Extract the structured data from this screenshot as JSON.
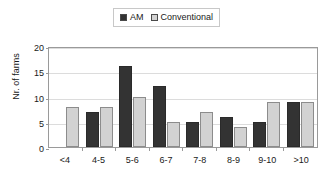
{
  "chart_data": {
    "type": "bar",
    "title": "",
    "xlabel": "",
    "ylabel": "Nr. of farms",
    "categories": [
      "<4",
      "4-5",
      "5-6",
      "6-7",
      "7-8",
      "8-9",
      "9-10",
      ">10"
    ],
    "series": [
      {
        "name": "AM",
        "color": "#333333",
        "values": [
          0,
          7,
          16,
          12,
          5,
          6,
          5,
          9
        ]
      },
      {
        "name": "Conventional",
        "color": "#d2d2d2",
        "values": [
          8,
          8,
          10,
          5,
          7,
          4,
          9,
          9
        ]
      }
    ],
    "ylim": [
      0,
      20
    ],
    "yticks": [
      0,
      5,
      10,
      15,
      20
    ],
    "ytick_labels": [
      "0",
      "5",
      "10",
      "15",
      "20"
    ],
    "grid": true,
    "legend_position": "top-center"
  },
  "legend": {
    "entries": [
      {
        "label": "AM",
        "swatch": "dark-square-icon"
      },
      {
        "label": "Conventional",
        "swatch": "light-square-icon"
      }
    ]
  },
  "axes": {
    "y_title": "Nr. of farms"
  }
}
